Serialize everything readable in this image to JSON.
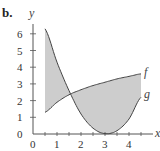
{
  "chart_data": {
    "type": "area",
    "title": "",
    "part_label": "b.",
    "xlabel": "x",
    "ylabel": "y",
    "xlim": [
      0,
      4.8
    ],
    "ylim": [
      0,
      6.5
    ],
    "x_ticks": [
      "0",
      "1",
      "2",
      "3",
      "4"
    ],
    "y_ticks": [
      "0",
      "1",
      "2",
      "3",
      "4",
      "5",
      "6"
    ],
    "grid": false,
    "series": [
      {
        "name": "f",
        "x": [
          0.5,
          1.0,
          1.5,
          2.0,
          2.5,
          3.0,
          3.5,
          4.0,
          4.5
        ],
        "values": [
          1.3,
          1.9,
          2.35,
          2.65,
          2.9,
          3.1,
          3.3,
          3.45,
          3.6
        ]
      },
      {
        "name": "g",
        "x": [
          0.5,
          1.0,
          1.5,
          2.0,
          2.5,
          3.0,
          3.5,
          4.0,
          4.5
        ],
        "values": [
          6.3,
          4.3,
          2.6,
          1.2,
          0.35,
          0.02,
          0.2,
          0.9,
          2.2
        ]
      }
    ],
    "shaded_region": "area between f and g for 0.5 ≤ x ≤ 4.5",
    "colors": {
      "fill": "#cdcdcd",
      "curve": "#444444",
      "axis": "#555555"
    }
  }
}
